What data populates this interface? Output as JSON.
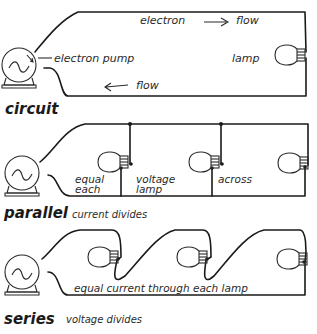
{
  "diagrams": {
    "circuit": {
      "title": "circuit",
      "labels": {
        "electron": "electron",
        "flow_top": "flow",
        "pump": "electron pump",
        "lamp": "lamp",
        "flow_bottom": "flow"
      },
      "arrows": [
        "arrow-right",
        "arrow-left",
        "arrow-pointer"
      ]
    },
    "parallel": {
      "title": "parallel",
      "subtitle": "current divides",
      "labels": {
        "equal": "equal",
        "each": "each",
        "voltage": "voltage",
        "lamp": "lamp",
        "across": "across"
      },
      "lamp_count": 3
    },
    "series": {
      "title": "series",
      "subtitle": "voltage divides",
      "labels": {
        "note": "equal current through each lamp"
      },
      "lamp_count": 3
    }
  },
  "colors": {
    "ink": "#1a1a1a",
    "background": "#ffffff"
  }
}
